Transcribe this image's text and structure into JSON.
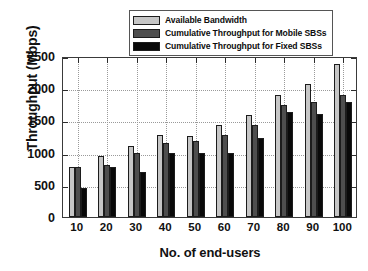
{
  "chart_data": {
    "type": "bar",
    "title": "",
    "xlabel": "No. of end-users",
    "ylabel": "Throughput (Mbps)",
    "categories": [
      "10",
      "20",
      "30",
      "40",
      "50",
      "60",
      "70",
      "80",
      "90",
      "100"
    ],
    "series": [
      {
        "name": "Available Bandwidth",
        "color": "#c6c6c6",
        "values": [
          780,
          955,
          1110,
          1270,
          1260,
          1425,
          1585,
          1900,
          2060,
          2380
        ]
      },
      {
        "name": "Cumulative Throughput for Mobile SBSs",
        "color": "#4e4e4e",
        "values": [
          780,
          810,
          1000,
          1145,
          1175,
          1275,
          1430,
          1745,
          1780,
          1890
        ]
      },
      {
        "name": "Cumulative Throughput for Fixed SBSs",
        "color": "#090909",
        "values": [
          450,
          770,
          700,
          990,
          995,
          990,
          1230,
          1630,
          1605,
          1780
        ]
      }
    ],
    "ylim": [
      0,
      2500
    ],
    "yticks": [
      0,
      500,
      1000,
      1500,
      2000,
      2500
    ],
    "ytick_labels": [
      "0",
      "500",
      "1000",
      "1500",
      "2000",
      "2500"
    ],
    "grid": "dotted both axes",
    "legend_position": "top-center"
  },
  "legend": {
    "items": [
      {
        "label": "Available Bandwidth",
        "color": "#c6c6c6"
      },
      {
        "label": "Cumulative Throughput for Mobile SBSs",
        "color": "#4e4e4e"
      },
      {
        "label": "Cumulative Throughput for Fixed SBSs",
        "color": "#090909"
      }
    ]
  }
}
